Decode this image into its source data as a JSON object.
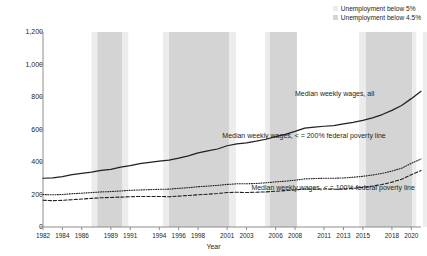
{
  "legend": {
    "items": [
      {
        "label": "Unemployment below 5%",
        "color": "#ececec",
        "name": "legend-swatch-below-5"
      },
      {
        "label": "Unemployment below 4.5%",
        "color": "#d4d4d4",
        "name": "legend-swatch-below-4-5"
      }
    ]
  },
  "chart_data": {
    "type": "line",
    "title": "",
    "xlabel": "Year",
    "ylabel": "Dollars (nominal)",
    "xlim": [
      1982,
      2021
    ],
    "ylim": [
      0,
      1200
    ],
    "yticks": [
      0,
      200,
      400,
      600,
      800,
      1000,
      1200
    ],
    "ytick_labels": [
      "0",
      "200",
      "400",
      "600",
      "800",
      "1,000",
      "1,200"
    ],
    "xticks": [
      1982,
      1984,
      1986,
      1989,
      1991,
      1994,
      1996,
      1998,
      2001,
      2003,
      2006,
      2008,
      2011,
      2013,
      2015,
      2018,
      2020
    ],
    "xtick_labels": [
      "1982",
      "1984",
      "1986",
      "1989",
      "1991",
      "1994",
      "1996",
      "1998",
      "2001",
      "2003",
      "2006",
      "2008",
      "2011",
      "2013",
      "2015",
      "2018",
      "2020"
    ],
    "grid": false,
    "legend_position": "top-right",
    "x": [
      1982,
      1983,
      1984,
      1985,
      1986,
      1987,
      1988,
      1989,
      1990,
      1991,
      1992,
      1993,
      1994,
      1995,
      1996,
      1997,
      1998,
      1999,
      2000,
      2001,
      2002,
      2003,
      2004,
      2005,
      2006,
      2007,
      2008,
      2009,
      2010,
      2011,
      2012,
      2013,
      2014,
      2015,
      2016,
      2017,
      2018,
      2019,
      2020,
      2021
    ],
    "series": [
      {
        "name": "Median weekly wages, all",
        "style": "solid",
        "color": "#231f20",
        "values": [
          300,
          302,
          310,
          322,
          330,
          338,
          348,
          355,
          368,
          378,
          390,
          398,
          406,
          412,
          424,
          438,
          456,
          468,
          480,
          500,
          512,
          518,
          528,
          540,
          556,
          570,
          588,
          608,
          614,
          620,
          624,
          634,
          644,
          656,
          672,
          692,
          718,
          748,
          790,
          835
        ]
      },
      {
        "name": "Median weekly wages, < = 200% federal poverty line",
        "style": "dotted",
        "color": "#231f20",
        "values": [
          200,
          198,
          200,
          205,
          208,
          212,
          216,
          218,
          222,
          226,
          228,
          230,
          232,
          233,
          238,
          242,
          248,
          252,
          256,
          262,
          266,
          266,
          268,
          272,
          278,
          282,
          288,
          296,
          298,
          300,
          300,
          302,
          306,
          312,
          320,
          330,
          344,
          362,
          392,
          418
        ]
      },
      {
        "name": "Median weekly wages, < = 100% federal poverty line",
        "style": "dashed",
        "color": "#231f20",
        "values": [
          165,
          162,
          164,
          168,
          172,
          176,
          180,
          182,
          184,
          186,
          188,
          188,
          188,
          186,
          190,
          194,
          198,
          202,
          206,
          212,
          214,
          212,
          214,
          216,
          220,
          224,
          228,
          234,
          234,
          234,
          232,
          234,
          238,
          244,
          252,
          262,
          276,
          294,
          322,
          348
        ]
      }
    ],
    "shaded_bands": [
      {
        "start": 1987.0,
        "end": 1987.6,
        "type": "below 5%",
        "color": "#ececec"
      },
      {
        "start": 1987.6,
        "end": 1990.2,
        "type": "below 4.5%",
        "color": "#d4d4d4"
      },
      {
        "start": 1990.2,
        "end": 1990.8,
        "type": "below 5%",
        "color": "#ececec"
      },
      {
        "start": 1994.4,
        "end": 1995.0,
        "type": "below 5%",
        "color": "#ececec"
      },
      {
        "start": 1995.0,
        "end": 2001.2,
        "type": "below 4.5%",
        "color": "#d4d4d4"
      },
      {
        "start": 2001.2,
        "end": 2001.9,
        "type": "below 5%",
        "color": "#ececec"
      },
      {
        "start": 2004.9,
        "end": 2005.4,
        "type": "below 5%",
        "color": "#ececec"
      },
      {
        "start": 2005.4,
        "end": 2008.2,
        "type": "below 4.5%",
        "color": "#d4d4d4"
      },
      {
        "start": 2014.6,
        "end": 2015.3,
        "type": "below 5%",
        "color": "#ececec"
      },
      {
        "start": 2015.3,
        "end": 2020.1,
        "type": "below 4.5%",
        "color": "#d4d4d4"
      },
      {
        "start": 2020.1,
        "end": 2020.5,
        "type": "below 5%",
        "color": "#ececec"
      },
      {
        "start": 2021.2,
        "end": 2021.6,
        "type": "below 5%",
        "color": "#ececec"
      }
    ],
    "annotations": [
      {
        "text": "Median weekly wages, all",
        "x": 2008.0,
        "y": 810,
        "name": "annotation-all"
      },
      {
        "text": "Median weekly wages, < = 200% federal poverty line",
        "x": 2000.5,
        "y": 553,
        "name": "annotation-200-fpl"
      },
      {
        "text": "Median weekly wages, < = 100% federal poverty line",
        "x": 2003.5,
        "y": 233,
        "name": "annotation-100-fpl"
      }
    ]
  }
}
